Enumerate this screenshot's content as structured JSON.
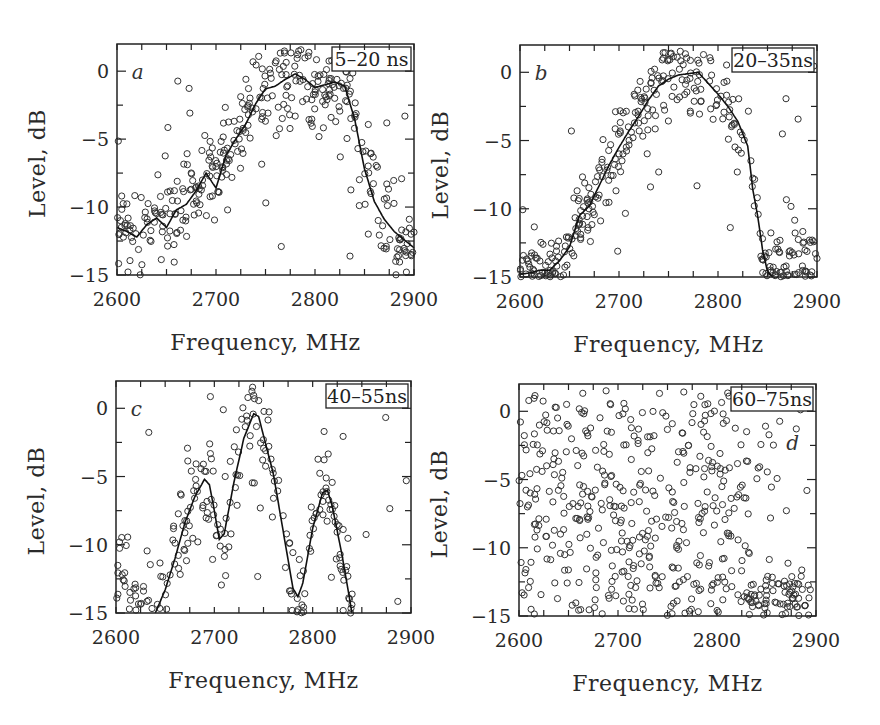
{
  "chart_data": [
    {
      "id": "a",
      "type": "scatter",
      "panel_letter": "a",
      "legend": "5–20 ns",
      "title": "",
      "xlabel": "Frequency,  MHz",
      "ylabel": "Level,  dB",
      "xlim": [
        2600,
        2900
      ],
      "ylim": [
        -15,
        2
      ],
      "xticks": [
        2600,
        2700,
        2800,
        2900
      ],
      "yticks": [
        0,
        -5,
        -10,
        -15
      ],
      "grid": false,
      "box": {
        "x0": 117,
        "x1": 414,
        "y0": 44,
        "y1": 275
      },
      "fit_curve": {
        "x": [
          2600,
          2610,
          2620,
          2630,
          2640,
          2650,
          2660,
          2670,
          2680,
          2690,
          2700,
          2710,
          2720,
          2730,
          2740,
          2750,
          2760,
          2770,
          2780,
          2790,
          2800,
          2810,
          2820,
          2830,
          2840,
          2850,
          2860,
          2870,
          2880,
          2890,
          2900
        ],
        "y": [
          -11.5,
          -11.8,
          -12.2,
          -11.3,
          -10.8,
          -11.5,
          -10.2,
          -9.8,
          -8.8,
          -7.5,
          -8.6,
          -6.2,
          -5.0,
          -3.9,
          -2.4,
          -1.3,
          -1.1,
          -0.6,
          -0.2,
          -0.6,
          -1.2,
          -1.0,
          -0.8,
          -1.1,
          -3.5,
          -7.2,
          -9.6,
          -10.9,
          -11.8,
          -12.4,
          -13.0
        ]
      },
      "scatter_spread_db": 1.6,
      "scatter_density": 7
    },
    {
      "id": "b",
      "type": "scatter",
      "panel_letter": "b",
      "legend": "20–35ns",
      "title": "",
      "xlabel": "Frequency,  MHz",
      "ylabel": "Level,  dB",
      "xlim": [
        2600,
        2900
      ],
      "ylim": [
        -15,
        2
      ],
      "xticks": [
        2600,
        2700,
        2800,
        2900
      ],
      "yticks": [
        0,
        -5,
        -10,
        -15
      ],
      "grid": false,
      "box": {
        "x0": 520,
        "x1": 817,
        "y0": 45,
        "y1": 277
      },
      "fit_curve": {
        "x": [
          2600,
          2610,
          2620,
          2630,
          2640,
          2650,
          2660,
          2670,
          2680,
          2690,
          2700,
          2710,
          2720,
          2730,
          2740,
          2750,
          2760,
          2770,
          2780,
          2790,
          2800,
          2810,
          2820,
          2830,
          2835,
          2840,
          2845,
          2850,
          2855
        ],
        "y": [
          -14.8,
          -14.7,
          -14.5,
          -14.5,
          -13.8,
          -12.8,
          -10.5,
          -9.8,
          -8.3,
          -6.8,
          -5.5,
          -4.3,
          -3.2,
          -2.0,
          -1.0,
          -0.5,
          -0.2,
          -0.1,
          0.0,
          -0.8,
          -1.6,
          -2.5,
          -3.6,
          -5.4,
          -8.5,
          -10.5,
          -13.0,
          -14.6,
          -15.0
        ]
      },
      "scatter_spread_db": 1.4,
      "scatter_density": 7
    },
    {
      "id": "c",
      "type": "scatter",
      "panel_letter": "c",
      "legend": "40–55ns",
      "title": "",
      "xlabel": "Frequency,  MHz",
      "ylabel": "Level,  dB",
      "xlim": [
        2600,
        2900
      ],
      "ylim": [
        -15,
        2
      ],
      "xticks": [
        2600,
        2700,
        2800,
        2900
      ],
      "yticks": [
        0,
        -5,
        -10,
        -15
      ],
      "grid": false,
      "box": {
        "x0": 116,
        "x1": 411,
        "y0": 381,
        "y1": 613
      },
      "fit_curve": {
        "x": [
          2640,
          2650,
          2660,
          2670,
          2680,
          2690,
          2695,
          2700,
          2705,
          2710,
          2720,
          2730,
          2740,
          2745,
          2750,
          2760,
          2770,
          2780,
          2785,
          2790,
          2800,
          2810,
          2815,
          2820,
          2830,
          2840
        ],
        "y": [
          -15.0,
          -13.3,
          -11.0,
          -8.4,
          -6.5,
          -5.2,
          -5.6,
          -7.5,
          -9.6,
          -9.2,
          -5.4,
          -2.2,
          -0.4,
          -0.6,
          -2.0,
          -4.8,
          -9.0,
          -13.2,
          -13.8,
          -12.8,
          -8.8,
          -6.2,
          -6.0,
          -7.2,
          -10.8,
          -15.0
        ]
      },
      "scatter_spread_db": 1.5,
      "scatter_density": 6,
      "noise_floor_points": true
    },
    {
      "id": "d",
      "type": "scatter",
      "panel_letter": "d",
      "legend": "60–75ns",
      "title": "",
      "xlabel": "Frequency,  MHz",
      "ylabel": "Level,  dB",
      "xlim": [
        2600,
        2900
      ],
      "ylim": [
        -15,
        2
      ],
      "xticks": [
        2600,
        2700,
        2800,
        2900
      ],
      "yticks": [
        0,
        -5,
        -10,
        -15
      ],
      "grid": false,
      "box": {
        "x0": 519,
        "x1": 816,
        "y0": 384,
        "y1": 616
      },
      "fit_curve": null,
      "scatter_mode": "random",
      "scatter_count": 520
    }
  ]
}
